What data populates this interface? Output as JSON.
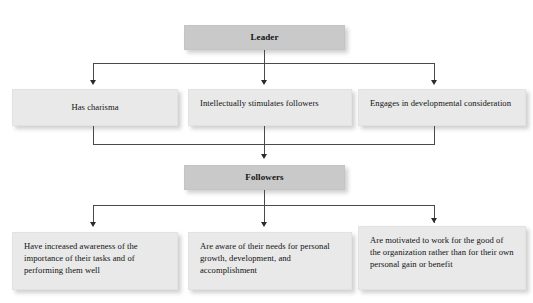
{
  "diagram": {
    "type": "hierarchy-flowchart",
    "colors": {
      "header_box_fill": "#c9c9c9",
      "body_box_fill": "#e9e9e9",
      "connector_line": "#4a4a4a",
      "arrow_fill": "#2b2b2b",
      "text": "#121212",
      "background": "#ffffff"
    },
    "sections": [
      {
        "id": "leader",
        "header": {
          "label": "Leader"
        },
        "children": [
          {
            "id": "leader-child-1",
            "label": "Has charisma"
          },
          {
            "id": "leader-child-2",
            "label": "Intellectually stimulates followers"
          },
          {
            "id": "leader-child-3",
            "label": "Engages in developmental consideration"
          }
        ]
      },
      {
        "id": "followers",
        "header": {
          "label": "Followers"
        },
        "children": [
          {
            "id": "follower-child-1",
            "label": "Have increased awareness of the importance of their tasks and of performing them well"
          },
          {
            "id": "follower-child-2",
            "label": "Are aware of their needs for personal growth, development, and accomplishment"
          },
          {
            "id": "follower-child-3",
            "label": "Are motivated to work for the good of the organization rather than for their own personal gain or benefit"
          }
        ]
      }
    ]
  }
}
